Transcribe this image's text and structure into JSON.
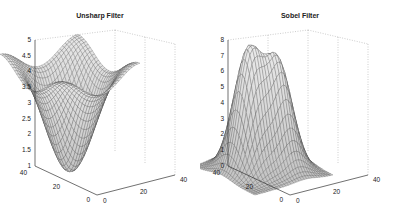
{
  "chart_data": [
    {
      "type": "surface",
      "title": "Unsharp Filter",
      "xlabel": "",
      "ylabel": "",
      "zlabel": "",
      "x_ticks": [
        "0",
        "20",
        "40"
      ],
      "y_ticks": [
        "0",
        "20",
        "40"
      ],
      "z_ticks": [
        "1",
        "1.5",
        "2",
        "2.5",
        "3",
        "3.5",
        "4",
        "4.5",
        "5"
      ],
      "xlim": [
        0,
        40
      ],
      "ylim": [
        0,
        40
      ],
      "zlim": [
        1,
        5
      ],
      "grid": true,
      "description": "Mesh surface with a deep central minimum (~1.2) surrounded by four ridge peaks reaching ~4.8; edges around 3.5",
      "features": {
        "min": 1.2,
        "max": 4.8,
        "edge_level": 3.5
      }
    },
    {
      "type": "surface",
      "title": "Sobel Filter",
      "xlabel": "",
      "ylabel": "",
      "zlabel": "",
      "x_ticks": [
        "0",
        "20",
        "40"
      ],
      "y_ticks": [
        "0",
        "20",
        "40"
      ],
      "z_ticks": [
        "0",
        "1",
        "2",
        "3",
        "4",
        "5",
        "6",
        "7",
        "8"
      ],
      "xlim": [
        0,
        40
      ],
      "ylim": [
        0,
        40
      ],
      "zlim": [
        0,
        8
      ],
      "grid": true,
      "description": "Mesh surface with two tall peaks (~7.5 and ~7) separated by a valley, falling to 0 at the edges",
      "features": {
        "min": 0,
        "max": 7.5,
        "second_peak": 7
      }
    }
  ]
}
